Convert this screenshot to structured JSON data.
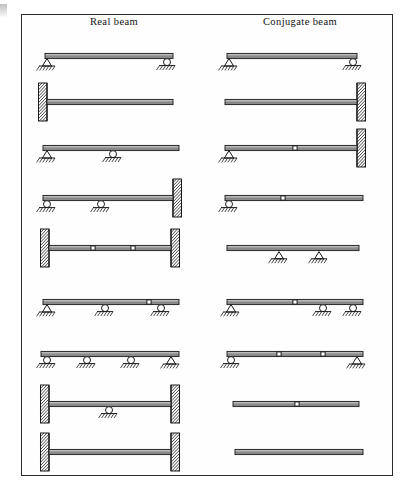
{
  "figure": {
    "title_left": "Real beam",
    "title_right": "Conjugate beam",
    "frame_color": "#2b2b2b",
    "beam_color": "#8a8a8a",
    "ink_color": "#1a1a1a",
    "row_count": 9
  },
  "legend_symbols": {
    "pin": "triangle pin support",
    "roller": "circle roller support",
    "fixed": "hatched fixed wall support",
    "free": "free end",
    "hinge": "small square internal hinge",
    "ground": "hatched ground"
  },
  "rows": [
    {
      "index": 1,
      "real": {
        "label": "simply supported beam",
        "left_end": "pin",
        "right_end": "roller",
        "supports": [
          "pin",
          "roller"
        ],
        "hinges": 0
      },
      "conjugate": {
        "label": "simply supported beam",
        "left_end": "pin",
        "right_end": "roller",
        "supports": [
          "pin",
          "roller"
        ],
        "hinges": 0
      }
    },
    {
      "index": 2,
      "real": {
        "label": "cantilever fixed at left",
        "left_end": "fixed",
        "right_end": "free",
        "supports": [
          "fixed"
        ],
        "hinges": 0
      },
      "conjugate": {
        "label": "cantilever fixed at right",
        "left_end": "free",
        "right_end": "fixed",
        "supports": [
          "fixed"
        ],
        "hinges": 0
      }
    },
    {
      "index": 3,
      "real": {
        "label": "beam with overhang, pin and interior roller",
        "left_end": "pin",
        "right_end": "free",
        "supports": [
          "pin",
          "roller"
        ],
        "hinges": 0
      },
      "conjugate": {
        "label": "pin at left, interior hinge, fixed at right",
        "left_end": "pin",
        "right_end": "fixed",
        "supports": [
          "pin",
          "fixed"
        ],
        "hinges": 1
      }
    },
    {
      "index": 4,
      "real": {
        "label": "two rollers with fixed right end",
        "left_end": "roller",
        "right_end": "fixed",
        "supports": [
          "roller",
          "roller",
          "fixed"
        ],
        "hinges": 0
      },
      "conjugate": {
        "label": "roller at left, interior hinge, free right end",
        "left_end": "roller",
        "right_end": "free",
        "supports": [
          "roller"
        ],
        "hinges": 1
      }
    },
    {
      "index": 5,
      "real": {
        "label": "fixed at both ends with two interior hinges",
        "left_end": "fixed",
        "right_end": "fixed",
        "supports": [
          "fixed",
          "fixed"
        ],
        "hinges": 2
      },
      "conjugate": {
        "label": "free at both ends with two interior pin supports",
        "left_end": "free",
        "right_end": "free",
        "supports": [
          "pin",
          "pin"
        ],
        "hinges": 0
      }
    },
    {
      "index": 6,
      "real": {
        "label": "pin and two rollers with interior hinge",
        "left_end": "pin",
        "right_end": "free",
        "supports": [
          "pin",
          "roller",
          "roller"
        ],
        "hinges": 1
      },
      "conjugate": {
        "label": "pin, interior hinge, two rollers",
        "left_end": "pin",
        "right_end": "free",
        "supports": [
          "pin",
          "roller",
          "roller"
        ],
        "hinges": 1
      }
    },
    {
      "index": 7,
      "real": {
        "label": "three rollers and a pin at right end",
        "left_end": "roller",
        "right_end": "pin",
        "supports": [
          "roller",
          "roller",
          "roller",
          "pin"
        ],
        "hinges": 0
      },
      "conjugate": {
        "label": "roller at left, two interior hinges, pin at right",
        "left_end": "roller",
        "right_end": "pin",
        "supports": [
          "roller",
          "pin"
        ],
        "hinges": 2
      }
    },
    {
      "index": 8,
      "real": {
        "label": "fixed at both ends with a central roller",
        "left_end": "fixed",
        "right_end": "fixed",
        "supports": [
          "fixed",
          "roller",
          "fixed"
        ],
        "hinges": 0
      },
      "conjugate": {
        "label": "free beam with one central hinge",
        "left_end": "free",
        "right_end": "free",
        "supports": [],
        "hinges": 1
      }
    },
    {
      "index": 9,
      "real": {
        "label": "fixed at both ends",
        "left_end": "fixed",
        "right_end": "fixed",
        "supports": [
          "fixed",
          "fixed"
        ],
        "hinges": 0
      },
      "conjugate": {
        "label": "completely free beam",
        "left_end": "free",
        "right_end": "free",
        "supports": [],
        "hinges": 0
      }
    }
  ]
}
